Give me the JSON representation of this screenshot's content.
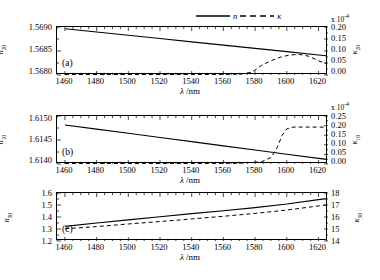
{
  "figure": {
    "legend": {
      "solid_label": "n",
      "dashed_label": "κ"
    },
    "xaxis_title": "λ /nm",
    "exponent_label": "x 10",
    "exponent_sup": "-4"
  },
  "chart_data": [
    {
      "type": "line",
      "panel": "(a)",
      "title": "",
      "xlabel": "λ /nm",
      "ylabel": "n20",
      "ylabel_base": "n",
      "ylabel_sub": "20",
      "y2label_base": "κ",
      "y2label_sub": "20",
      "xlim": [
        1455,
        1626
      ],
      "ylim": [
        1.568,
        1.5691
      ],
      "y2lim": [
        0.0,
        0.21
      ],
      "y2_scale_note": "x 10^-4",
      "grid": false,
      "legend_position": "top-right",
      "xticks": [
        1460,
        1480,
        1500,
        1520,
        1540,
        1560,
        1580,
        1600,
        1620
      ],
      "yticks": [
        "1.5680",
        "1.5685",
        "1.5690"
      ],
      "y2ticks": [
        "0.00",
        "0.05",
        "0.10",
        "0.15",
        "0.20"
      ],
      "series": [
        {
          "name": "n",
          "style": "solid",
          "axis": "left",
          "x": [
            1460,
            1480,
            1500,
            1520,
            1540,
            1560,
            1580,
            1600,
            1620,
            1625
          ],
          "values": [
            1.56906,
            1.568985,
            1.56891,
            1.568835,
            1.56876,
            1.568685,
            1.56861,
            1.568535,
            1.56846,
            1.568441
          ]
        },
        {
          "name": "κ",
          "style": "dashed",
          "axis": "right",
          "x": [
            1460,
            1500,
            1540,
            1570,
            1578,
            1584,
            1590,
            1596,
            1602,
            1608,
            1614,
            1620,
            1625
          ],
          "values": [
            0.002,
            0.002,
            0.002,
            0.003,
            0.012,
            0.042,
            0.062,
            0.078,
            0.088,
            0.09,
            0.082,
            0.062,
            0.05
          ]
        }
      ]
    },
    {
      "type": "line",
      "panel": "(b)",
      "title": "",
      "xlabel": "λ /nm",
      "ylabel": "n10",
      "ylabel_base": "n",
      "ylabel_sub": "10",
      "y2label_base": "κ",
      "y2label_sub": "10",
      "xlim": [
        1455,
        1626
      ],
      "ylim": [
        1.614,
        1.61515
      ],
      "y2lim": [
        0.0,
        0.26
      ],
      "y2_scale_note": "x 10^-4",
      "grid": false,
      "legend_position": "none",
      "xticks": [
        1460,
        1480,
        1500,
        1520,
        1540,
        1560,
        1580,
        1600,
        1620
      ],
      "yticks": [
        "1.6140",
        "1.6145",
        "1.6150"
      ],
      "y2ticks": [
        "0.00",
        "0.05",
        "0.10",
        "0.15",
        "0.20",
        "0.25"
      ],
      "series": [
        {
          "name": "n",
          "style": "solid",
          "axis": "left",
          "x": [
            1460,
            1480,
            1500,
            1520,
            1540,
            1560,
            1580,
            1600,
            1620,
            1625
          ],
          "values": [
            1.614935,
            1.614835,
            1.614735,
            1.614635,
            1.614535,
            1.614435,
            1.614335,
            1.614235,
            1.614135,
            1.61411
          ]
        },
        {
          "name": "κ",
          "style": "dashed",
          "axis": "right",
          "x": [
            1460,
            1500,
            1540,
            1570,
            1584,
            1590,
            1594,
            1597,
            1600,
            1604,
            1612,
            1620,
            1625
          ],
          "values": [
            0.003,
            0.003,
            0.003,
            0.004,
            0.012,
            0.035,
            0.09,
            0.155,
            0.19,
            0.2,
            0.2,
            0.2,
            0.2
          ]
        }
      ]
    },
    {
      "type": "line",
      "panel": "(c)",
      "title": "",
      "xlabel": "λ /nm",
      "ylabel": "n30",
      "ylabel_base": "n",
      "ylabel_sub": "30",
      "y2label_base": "κ",
      "y2label_sub": "30",
      "xlim": [
        1455,
        1626
      ],
      "ylim": [
        1.2,
        1.6
      ],
      "y2lim": [
        14,
        18
      ],
      "grid": false,
      "legend_position": "none",
      "xticks": [
        1460,
        1480,
        1500,
        1520,
        1540,
        1560,
        1580,
        1600,
        1620
      ],
      "yticks": [
        "1.2",
        "1.3",
        "1.4",
        "1.5",
        "1.6"
      ],
      "y2ticks": [
        "14",
        "15",
        "16",
        "17",
        "18"
      ],
      "series": [
        {
          "name": "n",
          "style": "solid",
          "axis": "left",
          "x": [
            1460,
            1480,
            1500,
            1520,
            1540,
            1560,
            1580,
            1600,
            1620,
            1625
          ],
          "values": [
            1.322,
            1.35,
            1.376,
            1.402,
            1.428,
            1.452,
            1.478,
            1.508,
            1.545,
            1.553
          ]
        },
        {
          "name": "κ",
          "style": "dashed",
          "axis": "right",
          "x": [
            1460,
            1480,
            1500,
            1520,
            1540,
            1560,
            1580,
            1600,
            1620,
            1625
          ],
          "values": [
            15.02,
            15.2,
            15.42,
            15.62,
            15.84,
            16.06,
            16.3,
            16.58,
            16.92,
            17.0
          ]
        }
      ]
    }
  ]
}
